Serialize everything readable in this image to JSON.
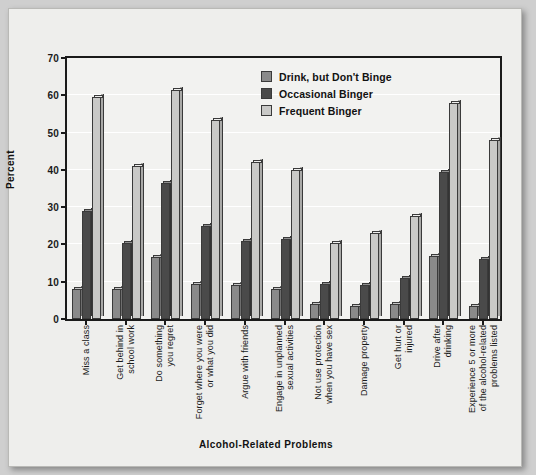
{
  "chart_data": {
    "type": "bar",
    "title": "",
    "xlabel": "Alcohol-Related Problems",
    "ylabel": "Percent",
    "ylim": [
      0,
      70
    ],
    "yticks": [
      0,
      10,
      20,
      30,
      40,
      50,
      60,
      70
    ],
    "grid": true,
    "legend_position": "top-center-right",
    "categories": [
      "Miss a class",
      "Get behind in\nschool work",
      "Do something\nyou regret",
      "Forget where you were\nor what you did",
      "Argue with friends",
      "Engage in unplanned\nsexual activities",
      "Not use protection\nwhen you have sex",
      "Damage property",
      "Get hurt or\ninjured",
      "Drive after\ndrinking",
      "Experience 5 or more\nof the alcohol-related\nproblems listed"
    ],
    "series": [
      {
        "name": "Drink, but Don't Binge",
        "color": "#8a8a8a",
        "values": [
          8,
          8,
          16.5,
          9.5,
          9,
          8,
          4,
          3.5,
          4,
          17,
          3.5
        ]
      },
      {
        "name": "Occasional Binger",
        "color": "#4a4a4a",
        "values": [
          29,
          20.5,
          36.5,
          25,
          21,
          21.5,
          9.5,
          9,
          11,
          39.5,
          16
        ]
      },
      {
        "name": "Frequent Binger",
        "color": "#c9c9c7",
        "values": [
          59.5,
          41,
          61.5,
          53.5,
          42,
          40,
          20.5,
          23,
          27.5,
          58,
          48
        ]
      }
    ]
  }
}
